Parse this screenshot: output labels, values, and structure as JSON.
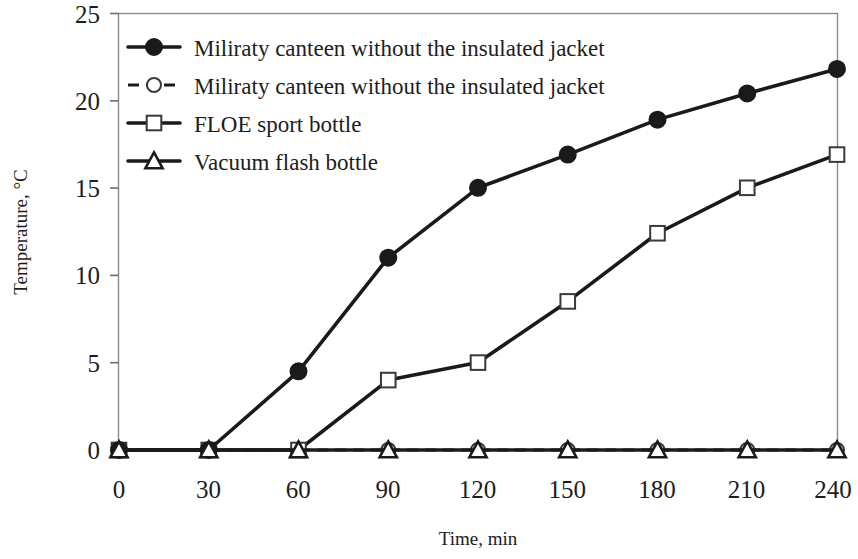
{
  "chart_data": {
    "type": "line",
    "title": "",
    "xlabel": "Time, min",
    "ylabel": "Temperature, °C",
    "x": [
      0,
      30,
      60,
      90,
      120,
      150,
      180,
      210,
      240
    ],
    "xtick_labels": [
      "0",
      "30",
      "60",
      "90",
      "120",
      "150",
      "180",
      "210",
      "240"
    ],
    "ytick_labels": [
      "0",
      "5",
      "10",
      "15",
      "20",
      "25"
    ],
    "xlim": [
      0,
      240
    ],
    "ylim": [
      0,
      25
    ],
    "grid": false,
    "legend_position": "top-left-inside",
    "series": [
      {
        "name": "Miliraty canteen without the insulated jacket",
        "marker": "filled-circle",
        "line_style": "solid",
        "values": [
          0,
          0,
          4.5,
          11.0,
          15.0,
          16.9,
          18.9,
          20.4,
          21.8
        ]
      },
      {
        "name": "Miliraty canteen without the insulated jacket",
        "marker": "open-circle",
        "line_style": "dashed",
        "values": [
          0,
          0,
          0,
          0,
          0,
          0,
          0,
          0,
          0
        ]
      },
      {
        "name": "FLOE sport bottle",
        "marker": "open-square",
        "line_style": "solid",
        "values": [
          0,
          0,
          0,
          4.0,
          5.0,
          8.5,
          12.4,
          15.0,
          16.9
        ]
      },
      {
        "name": "Vacuum flash bottle",
        "marker": "open-triangle",
        "line_style": "solid",
        "values": [
          0,
          0,
          0,
          0,
          0,
          0,
          0,
          0,
          0
        ]
      }
    ],
    "colors": {
      "series_line": "#1a1a1a",
      "axis": "#8a8a8a",
      "text": "#1d1d1d",
      "background": "#ffffff"
    }
  },
  "legend": {
    "entries": [
      {
        "label": "Miliraty canteen without the insulated jacket",
        "marker": "filled-circle",
        "line_style": "solid"
      },
      {
        "label": "Miliraty canteen without the insulated jacket",
        "marker": "open-circle",
        "line_style": "dashed"
      },
      {
        "label": "FLOE sport bottle",
        "marker": "open-square",
        "line_style": "solid"
      },
      {
        "label": "Vacuum flash bottle",
        "marker": "open-triangle",
        "line_style": "solid"
      }
    ]
  },
  "axes": {
    "y_title": "Temperature, °C",
    "x_title": "Time, min",
    "y_ticks": [
      "25",
      "20",
      "15",
      "10",
      "5",
      "0"
    ],
    "x_ticks": [
      "0",
      "30",
      "60",
      "90",
      "120",
      "150",
      "180",
      "210",
      "240"
    ]
  }
}
